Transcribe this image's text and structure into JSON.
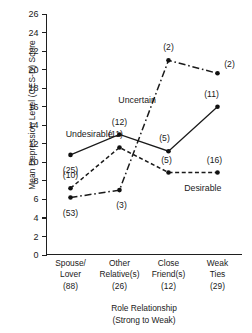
{
  "chart_data": {
    "type": "line",
    "title": "",
    "xlabel": "Role Relationship",
    "xlabel_sub": "(Strong to Weak)",
    "ylabel": "Mean Depression Level (CES-D) Score",
    "ylim": [
      0,
      26
    ],
    "ytick_step": 2,
    "yticks": [
      26,
      24,
      22,
      20,
      18,
      16,
      14,
      12,
      10,
      8,
      6,
      4,
      2,
      0
    ],
    "grid": false,
    "legend_position": "inline-annotations",
    "categories": [
      "Spouse/ Lover",
      "Other Relative(s)",
      "Close Friend(s)",
      "Weak Ties"
    ],
    "category_lines": [
      [
        "Spouse/",
        "Lover",
        "(88)"
      ],
      [
        "Other",
        "Relative(s)",
        "(26)"
      ],
      [
        "Close",
        "Friend(s)",
        "(12)"
      ],
      [
        "Weak",
        "Ties",
        "(29)"
      ]
    ],
    "category_counts": [
      88,
      26,
      12,
      29
    ],
    "series": [
      {
        "name": "Undesirable",
        "style": "solid",
        "values": [
          10.8,
          13.0,
          11.2,
          16.0
        ],
        "n_labels": [
          "(25)",
          "(12)",
          "(5)",
          "(11)"
        ],
        "n_values": [
          25,
          12,
          5,
          11
        ],
        "label_offsets": [
          [
            0,
            15
          ],
          [
            0,
            -13
          ],
          [
            -4,
            -13
          ],
          [
            -6,
            -13
          ]
        ]
      },
      {
        "name": "Desirable",
        "style": "dashed",
        "values": [
          7.2,
          11.6,
          8.9,
          8.9
        ],
        "n_labels": [
          "(10)",
          "(11)",
          "(5)",
          "(16)"
        ],
        "n_values": [
          10,
          11,
          5,
          16
        ],
        "label_offsets": [
          [
            0,
            -13
          ],
          [
            -4,
            -13
          ],
          [
            -2,
            -13
          ],
          [
            -3,
            -13
          ]
        ]
      },
      {
        "name": "Uncertain",
        "style": "dashdot",
        "values": [
          6.2,
          7.0,
          21.0,
          19.6
        ],
        "n_labels": [
          "(53)",
          "(3)",
          "(2)",
          "(2)"
        ],
        "n_values": [
          53,
          3,
          2,
          2
        ],
        "label_offsets": [
          [
            0,
            15
          ],
          [
            2,
            15
          ],
          [
            0,
            -13
          ],
          [
            12,
            -9
          ]
        ]
      }
    ],
    "series_name_positions": [
      {
        "name": "Undesirable",
        "x_frac": 0.22,
        "y_value": 13.1
      },
      {
        "name": "Desirable",
        "x_frac": 0.8,
        "y_value": 7.2
      },
      {
        "name": "Uncertain",
        "x_frac": 0.465,
        "y_value": 16.7
      }
    ],
    "colors": {
      "axis": "#1f1f1f",
      "line": "#1a1a1a",
      "marker": "#111111",
      "text": "#1a1a1a",
      "background": "#ffffff"
    }
  }
}
